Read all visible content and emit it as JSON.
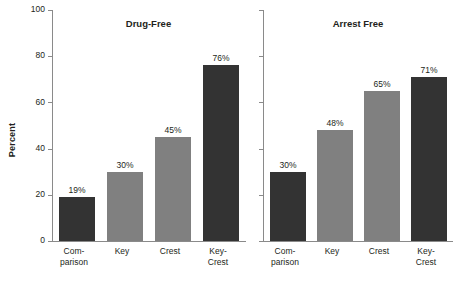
{
  "chart_data": {
    "type": "bar",
    "title": "",
    "xlabel": "",
    "ylabel": "Percent",
    "ylim": [
      0,
      100
    ],
    "ytick_labels": [
      "0",
      "20",
      "40",
      "60",
      "80",
      "100"
    ],
    "yticks": [
      0,
      20,
      40,
      60,
      80,
      100
    ],
    "grid": false,
    "legend": "none",
    "categories": [
      "Com-\nparison",
      "Key",
      "Crest",
      "Key-\nCrest"
    ],
    "panels": [
      {
        "title": "Drug-Free",
        "show_y_tick_labels": true,
        "values": [
          19,
          30,
          45,
          76
        ],
        "value_labels": [
          "19%",
          "30%",
          "45%",
          "76%"
        ],
        "bar_colors": [
          "dark",
          "mid",
          "mid",
          "dark"
        ]
      },
      {
        "title": "Arrest Free",
        "show_y_tick_labels": false,
        "values": [
          30,
          48,
          65,
          71
        ],
        "value_labels": [
          "30%",
          "48%",
          "65%",
          "71%"
        ],
        "bar_colors": [
          "dark",
          "mid",
          "mid",
          "dark"
        ]
      }
    ],
    "colors": {
      "dark": "#333333",
      "mid": "#808080",
      "axis": "#8a8a8a",
      "text": "#231f20",
      "background": "#ffffff"
    }
  }
}
